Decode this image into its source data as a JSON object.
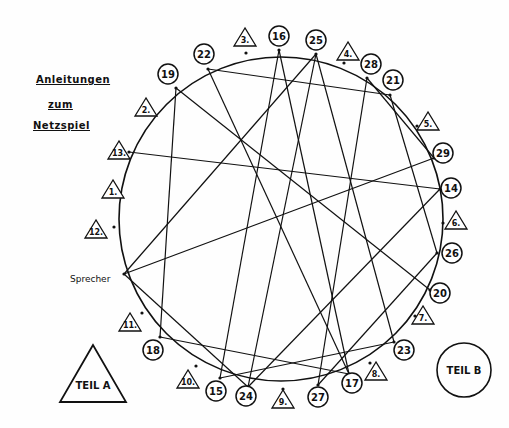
{
  "title": {
    "line1": "Anleitungen",
    "line2": "zum",
    "line3": "Netzspiel"
  },
  "speaker_label": "Sprecher",
  "teil_a": "TEIL A",
  "teil_b": "TEIL B",
  "circle_nodes": [
    {
      "id": "16",
      "x": 279,
      "y": 36,
      "px": 279,
      "py": 50
    },
    {
      "id": "25",
      "x": 316,
      "y": 40,
      "px": 316,
      "py": 54
    },
    {
      "id": "28",
      "x": 371,
      "y": 64,
      "px": 367,
      "py": 78
    },
    {
      "id": "21",
      "x": 393,
      "y": 80,
      "px": 390,
      "py": 95
    },
    {
      "id": "22",
      "x": 204,
      "y": 54,
      "px": 208,
      "py": 69
    },
    {
      "id": "19",
      "x": 168,
      "y": 74,
      "px": 176,
      "py": 88
    },
    {
      "id": "29",
      "x": 443,
      "y": 153,
      "px": 434,
      "py": 158
    },
    {
      "id": "14",
      "x": 451,
      "y": 188,
      "px": 440,
      "py": 189
    },
    {
      "id": "26",
      "x": 452,
      "y": 253,
      "px": 437,
      "py": 253
    },
    {
      "id": "20",
      "x": 440,
      "y": 293,
      "px": 430,
      "py": 290
    },
    {
      "id": "23",
      "x": 404,
      "y": 350,
      "px": 394,
      "py": 342
    },
    {
      "id": "17",
      "x": 352,
      "y": 383,
      "px": 349,
      "py": 374
    },
    {
      "id": "27",
      "x": 318,
      "y": 397,
      "px": 318,
      "py": 385
    },
    {
      "id": "24",
      "x": 246,
      "y": 396,
      "px": 248,
      "py": 387
    },
    {
      "id": "15",
      "x": 216,
      "y": 391,
      "px": 220,
      "py": 378
    },
    {
      "id": "18",
      "x": 153,
      "y": 350,
      "px": 160,
      "py": 337
    }
  ],
  "triangle_markers": [
    {
      "id": "3.",
      "x": 245,
      "y": 38,
      "px": 246,
      "py": 53
    },
    {
      "id": "4.",
      "x": 348,
      "y": 52,
      "px": 344,
      "py": 63
    },
    {
      "id": "5.",
      "x": 428,
      "y": 122,
      "px": 417,
      "py": 126
    },
    {
      "id": "6.",
      "x": 456,
      "y": 221,
      "px": 443,
      "py": 223
    },
    {
      "id": "7.",
      "x": 423,
      "y": 316,
      "px": 415,
      "py": 316
    },
    {
      "id": "8.",
      "x": 376,
      "y": 372,
      "px": 370,
      "py": 363
    },
    {
      "id": "9.",
      "x": 283,
      "y": 400,
      "px": 283,
      "py": 389
    },
    {
      "id": "10.",
      "x": 188,
      "y": 380,
      "px": 196,
      "py": 366
    },
    {
      "id": "11.",
      "x": 130,
      "y": 323,
      "px": 142,
      "py": 313
    },
    {
      "id": "12.",
      "x": 96,
      "y": 230,
      "px": 114,
      "py": 227
    },
    {
      "id": "1.",
      "x": 113,
      "y": 190,
      "px": 118,
      "py": 192
    },
    {
      "id": "13.",
      "x": 119,
      "y": 151,
      "px": 129,
      "py": 152
    },
    {
      "id": "2.",
      "x": 146,
      "y": 108,
      "px": 152,
      "py": 111
    }
  ],
  "speaker_point": {
    "px": 124,
    "py": 274
  },
  "connections": [
    [
      "22",
      "21"
    ],
    [
      "22",
      "17"
    ],
    [
      "19",
      "18"
    ],
    [
      "19",
      "20"
    ],
    [
      "16",
      "15"
    ],
    [
      "16",
      "17"
    ],
    [
      "25",
      "Sprecher"
    ],
    [
      "25",
      "24"
    ],
    [
      "25",
      "23"
    ],
    [
      "28",
      "27"
    ],
    [
      "28",
      "29"
    ],
    [
      "21",
      "26"
    ],
    [
      "13.",
      "14"
    ],
    [
      "29",
      "Sprecher"
    ],
    [
      "14",
      "24"
    ],
    [
      "26",
      "27"
    ],
    [
      "Sprecher",
      "24"
    ],
    [
      "18",
      "17"
    ],
    [
      "23",
      "15"
    ]
  ]
}
